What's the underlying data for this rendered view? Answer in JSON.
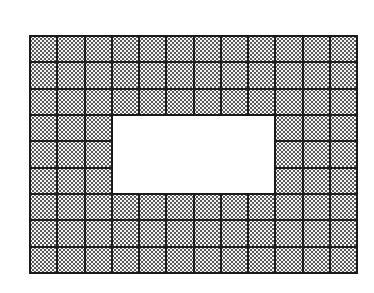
{
  "diagram": {
    "type": "tiled-grid-with-rectangular-hole",
    "columns": 12,
    "rows": 9,
    "hole": {
      "col_start": 3,
      "col_end": 8,
      "row_start": 3,
      "row_end": 5,
      "cols": 6,
      "rows": 3
    },
    "filled_cell_count": 90,
    "total_cell_count": 108,
    "fill_pattern": "dotted-stipple",
    "colors": {
      "line": "#1a1a1a",
      "dot": "#5a5a5a",
      "cell_background": "#f4f4f4",
      "hole": "#ffffff"
    }
  }
}
